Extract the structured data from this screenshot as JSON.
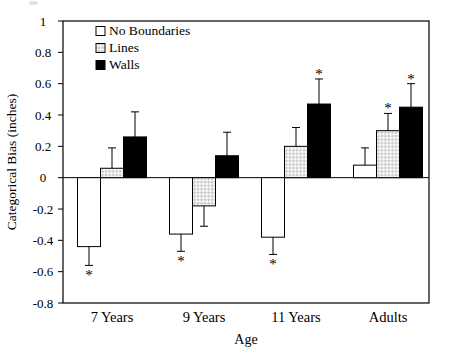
{
  "chart_data": {
    "type": "bar",
    "title": "",
    "xlabel": "Age",
    "ylabel": "Categorical Bias (inches)",
    "ylim": [
      -0.8,
      1
    ],
    "grid": false,
    "frame": true,
    "legend_position": "top-left-inside",
    "significance_marker": "*",
    "yticks": {
      "values": [
        1,
        0.8,
        0.6,
        0.4,
        0.2,
        0,
        -0.2,
        -0.4,
        -0.6,
        -0.8
      ],
      "labels": [
        "1",
        "0.8",
        "0.6",
        "0.4",
        "0.2",
        "0",
        "-0.2",
        "-0.4",
        "-0.6",
        "-0.8"
      ]
    },
    "categories": [
      "7 Years",
      "9 Years",
      "11 Years",
      "Adults"
    ],
    "series": [
      {
        "name": "No Boundaries",
        "fill": "white",
        "values": [
          -0.44,
          -0.36,
          -0.38,
          0.08
        ],
        "errors": [
          0.12,
          0.11,
          0.11,
          0.11
        ],
        "significant": [
          true,
          true,
          true,
          false
        ]
      },
      {
        "name": "Lines",
        "fill": "checker",
        "values": [
          0.06,
          -0.18,
          0.2,
          0.3
        ],
        "errors": [
          0.13,
          0.13,
          0.12,
          0.11
        ],
        "significant": [
          false,
          false,
          false,
          true
        ]
      },
      {
        "name": "Walls",
        "fill": "black",
        "values": [
          0.26,
          0.14,
          0.47,
          0.45
        ],
        "errors": [
          0.16,
          0.15,
          0.16,
          0.15
        ],
        "significant": [
          false,
          false,
          true,
          true
        ]
      }
    ],
    "colors": {
      "background": "#ffffff",
      "axis": "#000000",
      "text": "#000000",
      "bar_stroke": "#000000",
      "no_boundaries_fill": "#ffffff",
      "walls_fill": "#000000",
      "lines_pattern": "#c9c9c9"
    }
  }
}
